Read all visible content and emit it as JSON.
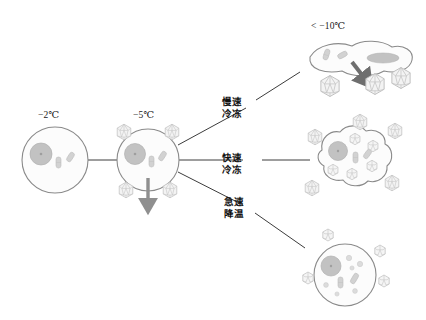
{
  "figure": {
    "type": "diagram",
    "background_color": "#ffffff",
    "line_color": "#3c3c3c",
    "membrane_color": "#8a8a8a",
    "nucleus_color": "#b9b9b9",
    "organelle_color": "#c9c9c9",
    "ice_crystal_color": "#bdbdbd",
    "arrow_color": "#8f8f8f",
    "arrow_color_dark": "#6e6e6e"
  },
  "temperatures": {
    "start": "−2℃",
    "nucleation": "−5℃",
    "deep": "< −10℃"
  },
  "paths": [
    {
      "id": "slow-freezing",
      "line1": "慢速",
      "line2": "冷冻"
    },
    {
      "id": "fast-freezing",
      "line1": "快速",
      "line2": "冷冻"
    },
    {
      "id": "rapid-cooling",
      "line1": "急速",
      "line2": "降温"
    }
  ],
  "cells": {
    "start": {
      "name": "intact-cell",
      "shape": "round",
      "nucleus": 1,
      "organelles": 2,
      "ice_crystals_outside": 0,
      "ice_crystals_inside": 0,
      "arrow": "none"
    },
    "nucleation": {
      "name": "extracellular-ice-cell",
      "shape": "round",
      "nucleus": 1,
      "organelles": 2,
      "ice_crystals_outside": 4,
      "ice_crystals_inside": 0,
      "arrow": "down"
    },
    "slow": {
      "name": "dehydrated-shrunken-cell",
      "shape": "shriveled",
      "nucleus": 1,
      "organelles": 3,
      "ice_crystals_outside": 3,
      "ice_crystals_inside": 0,
      "arrow": "down-right"
    },
    "fast": {
      "name": "intracellular-ice-cell",
      "shape": "lobed",
      "nucleus": 1,
      "organelles": 3,
      "ice_crystals_outside": 5,
      "ice_crystals_inside": 5,
      "arrow": "none"
    },
    "vitrified": {
      "name": "vitrified-cell",
      "shape": "round",
      "nucleus": 1,
      "organelles": 9,
      "ice_crystals_outside": 4,
      "ice_crystals_inside": 0,
      "arrow": "none"
    }
  }
}
